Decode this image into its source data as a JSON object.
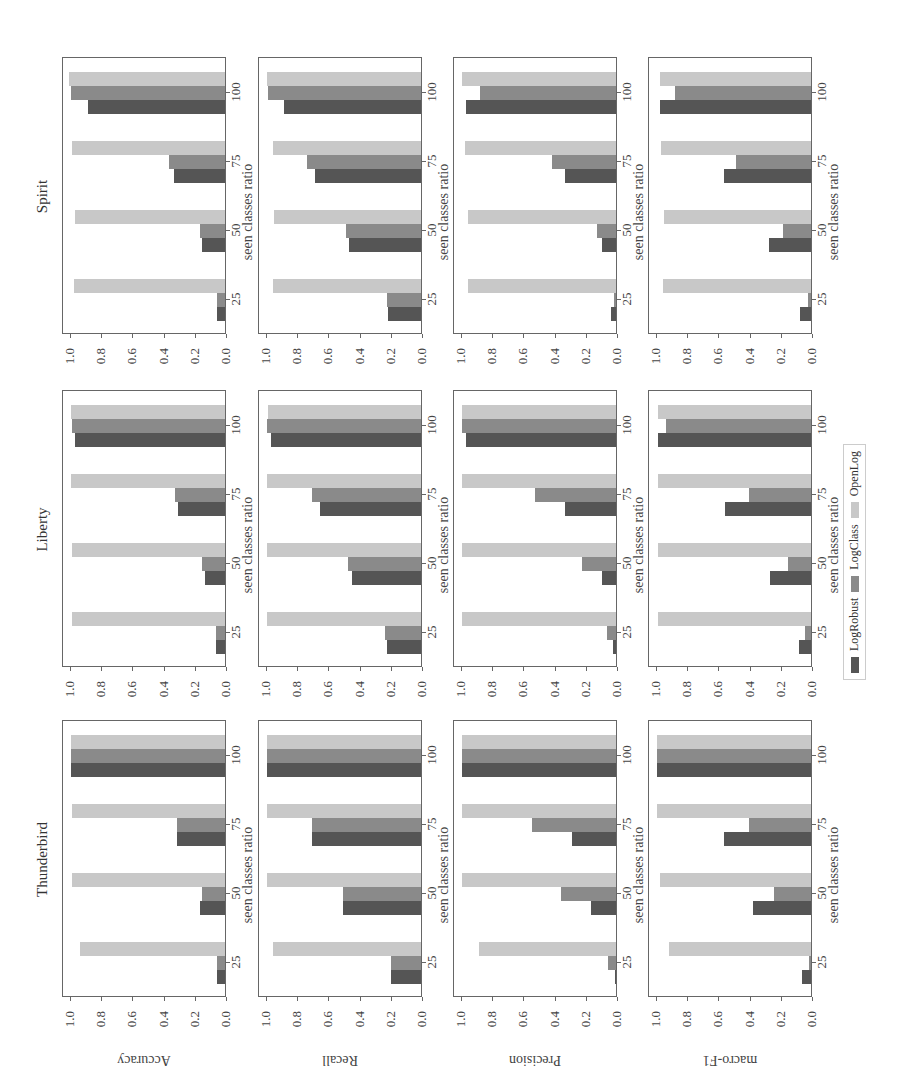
{
  "figure": {
    "orientation": "rotated 90 degrees counter-clockwise",
    "legend": [
      {
        "label": "LogRobust",
        "color": "#555555"
      },
      {
        "label": "LogClass",
        "color": "#8a8a8a"
      },
      {
        "label": "OpenLog",
        "color": "#c8c8c8"
      }
    ],
    "xlabel": "seen classes ratio",
    "datasets": [
      "Spirit",
      "Liberty",
      "Thunderbird"
    ],
    "metrics": [
      "Accuracy",
      "Recall",
      "Precision",
      "macro-F1"
    ],
    "yticks": [
      "0.0",
      "0.2",
      "0.4",
      "0.6",
      "0.8",
      "1.0"
    ],
    "xticks": [
      "25",
      "50",
      "75",
      "100"
    ]
  },
  "chart_data": [
    {
      "type": "bar",
      "title": "Spirit",
      "ylabel": "Accuracy",
      "xlabel": "seen classes ratio",
      "categories": [
        "25",
        "50",
        "75",
        "100"
      ],
      "ylim": [
        0,
        1.0
      ],
      "series": [
        {
          "name": "LogRobust",
          "values": [
            0.05,
            0.15,
            0.33,
            0.88
          ]
        },
        {
          "name": "LogClass",
          "values": [
            0.05,
            0.16,
            0.36,
            0.99
          ]
        },
        {
          "name": "OpenLog",
          "values": [
            0.97,
            0.96,
            0.98,
            1.0
          ]
        }
      ]
    },
    {
      "type": "bar",
      "title": "Spirit",
      "ylabel": "Recall",
      "xlabel": "seen classes ratio",
      "categories": [
        "25",
        "50",
        "75",
        "100"
      ],
      "ylim": [
        0,
        1.0
      ],
      "series": [
        {
          "name": "LogRobust",
          "values": [
            0.21,
            0.46,
            0.68,
            0.88
          ]
        },
        {
          "name": "LogClass",
          "values": [
            0.22,
            0.48,
            0.73,
            0.98
          ]
        },
        {
          "name": "OpenLog",
          "values": [
            0.95,
            0.94,
            0.95,
            0.99
          ]
        }
      ]
    },
    {
      "type": "bar",
      "title": "Spirit",
      "ylabel": "Precision",
      "xlabel": "seen classes ratio",
      "categories": [
        "25",
        "50",
        "75",
        "100"
      ],
      "ylim": [
        0,
        1.0
      ],
      "series": [
        {
          "name": "LogRobust",
          "values": [
            0.03,
            0.09,
            0.33,
            0.96
          ]
        },
        {
          "name": "LogClass",
          "values": [
            0.01,
            0.12,
            0.41,
            0.87
          ]
        },
        {
          "name": "OpenLog",
          "values": [
            0.95,
            0.95,
            0.97,
            0.99
          ]
        }
      ]
    },
    {
      "type": "bar",
      "title": "Spirit",
      "ylabel": "macro-F1",
      "xlabel": "seen classes ratio",
      "categories": [
        "25",
        "50",
        "75",
        "100"
      ],
      "ylim": [
        0,
        1.0
      ],
      "series": [
        {
          "name": "LogRobust",
          "values": [
            0.07,
            0.27,
            0.56,
            0.97
          ]
        },
        {
          "name": "LogClass",
          "values": [
            0.02,
            0.18,
            0.48,
            0.87
          ]
        },
        {
          "name": "OpenLog",
          "values": [
            0.95,
            0.94,
            0.96,
            0.97
          ]
        }
      ]
    },
    {
      "type": "bar",
      "title": "Liberty",
      "ylabel": "Accuracy",
      "xlabel": "seen classes ratio",
      "categories": [
        "25",
        "50",
        "75",
        "100"
      ],
      "ylim": [
        0,
        1.0
      ],
      "series": [
        {
          "name": "LogRobust",
          "values": [
            0.06,
            0.13,
            0.3,
            0.96
          ]
        },
        {
          "name": "LogClass",
          "values": [
            0.06,
            0.15,
            0.32,
            0.98
          ]
        },
        {
          "name": "OpenLog",
          "values": [
            0.98,
            0.98,
            0.99,
            0.99
          ]
        }
      ]
    },
    {
      "type": "bar",
      "title": "Liberty",
      "ylabel": "Recall",
      "xlabel": "seen classes ratio",
      "categories": [
        "25",
        "50",
        "75",
        "100"
      ],
      "ylim": [
        0,
        1.0
      ],
      "series": [
        {
          "name": "LogRobust",
          "values": [
            0.22,
            0.44,
            0.65,
            0.96
          ]
        },
        {
          "name": "LogClass",
          "values": [
            0.23,
            0.47,
            0.7,
            0.99
          ]
        },
        {
          "name": "OpenLog",
          "values": [
            0.99,
            0.99,
            0.99,
            0.98
          ]
        }
      ]
    },
    {
      "type": "bar",
      "title": "Liberty",
      "ylabel": "Precision",
      "xlabel": "seen classes ratio",
      "categories": [
        "25",
        "50",
        "75",
        "100"
      ],
      "ylim": [
        0,
        1.0
      ],
      "series": [
        {
          "name": "LogRobust",
          "values": [
            0.02,
            0.09,
            0.33,
            0.96
          ]
        },
        {
          "name": "LogClass",
          "values": [
            0.06,
            0.22,
            0.52,
            0.99
          ]
        },
        {
          "name": "OpenLog",
          "values": [
            0.99,
            0.99,
            0.99,
            0.99
          ]
        }
      ]
    },
    {
      "type": "bar",
      "title": "Liberty",
      "ylabel": "macro-F1",
      "xlabel": "seen classes ratio",
      "categories": [
        "25",
        "50",
        "75",
        "100"
      ],
      "ylim": [
        0,
        1.0
      ],
      "series": [
        {
          "name": "LogRobust",
          "values": [
            0.08,
            0.26,
            0.55,
            0.98
          ]
        },
        {
          "name": "LogClass",
          "values": [
            0.04,
            0.15,
            0.4,
            0.93
          ]
        },
        {
          "name": "OpenLog",
          "values": [
            0.98,
            0.98,
            0.98,
            0.98
          ]
        }
      ]
    },
    {
      "type": "bar",
      "title": "Thunderbird",
      "ylabel": "Accuracy",
      "xlabel": "seen classes ratio",
      "categories": [
        "25",
        "50",
        "75",
        "100"
      ],
      "ylim": [
        0,
        1.0
      ],
      "series": [
        {
          "name": "LogRobust",
          "values": [
            0.05,
            0.16,
            0.31,
            0.99
          ]
        },
        {
          "name": "LogClass",
          "values": [
            0.05,
            0.15,
            0.31,
            0.99
          ]
        },
        {
          "name": "OpenLog",
          "values": [
            0.93,
            0.98,
            0.98,
            0.99
          ]
        }
      ]
    },
    {
      "type": "bar",
      "title": "Thunderbird",
      "ylabel": "Recall",
      "xlabel": "seen classes ratio",
      "categories": [
        "25",
        "50",
        "75",
        "100"
      ],
      "ylim": [
        0,
        1.0
      ],
      "series": [
        {
          "name": "LogRobust",
          "values": [
            0.19,
            0.5,
            0.7,
            0.99
          ]
        },
        {
          "name": "LogClass",
          "values": [
            0.19,
            0.5,
            0.7,
            0.99
          ]
        },
        {
          "name": "OpenLog",
          "values": [
            0.95,
            0.99,
            0.99,
            0.99
          ]
        }
      ]
    },
    {
      "type": "bar",
      "title": "Thunderbird",
      "ylabel": "Precision",
      "xlabel": "seen classes ratio",
      "categories": [
        "25",
        "50",
        "75",
        "100"
      ],
      "ylim": [
        0,
        1.0
      ],
      "series": [
        {
          "name": "LogRobust",
          "values": [
            0.005,
            0.16,
            0.28,
            0.99
          ]
        },
        {
          "name": "LogClass",
          "values": [
            0.05,
            0.35,
            0.54,
            0.99
          ]
        },
        {
          "name": "OpenLog",
          "values": [
            0.88,
            0.99,
            0.99,
            0.99
          ]
        }
      ]
    },
    {
      "type": "bar",
      "title": "Thunderbird",
      "ylabel": "macro-F1",
      "xlabel": "seen classes ratio",
      "categories": [
        "25",
        "50",
        "75",
        "100"
      ],
      "ylim": [
        0,
        1.0
      ],
      "series": [
        {
          "name": "LogRobust",
          "values": [
            0.06,
            0.37,
            0.56,
            0.99
          ]
        },
        {
          "name": "LogClass",
          "values": [
            0.01,
            0.24,
            0.4,
            0.99
          ]
        },
        {
          "name": "OpenLog",
          "values": [
            0.91,
            0.97,
            0.99,
            0.99
          ]
        }
      ]
    }
  ]
}
